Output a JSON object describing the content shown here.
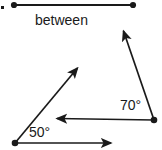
{
  "figure": {
    "background_color": "#ffffff",
    "stroke_color": "#1a1a1a",
    "labels": {
      "between": "between",
      "angle_right": "70°",
      "angle_left": "50°"
    },
    "geometry": {
      "segment_top": {
        "x1": 14,
        "y1": 5,
        "x2": 133,
        "y2": 5
      },
      "ray_upper_right": {
        "x1": 154,
        "y1": 120,
        "x2": 122,
        "y2": 27
      },
      "ray_horizontal_middle": {
        "x1": 154,
        "y1": 120,
        "x2": 53,
        "y2": 118
      },
      "ray_diagonal": {
        "x1": 15,
        "y1": 143,
        "x2": 80,
        "y2": 65
      },
      "ray_horizontal_bottom": {
        "x1": 15,
        "y1": 143,
        "x2": 115,
        "y2": 143
      },
      "vertex_right": {
        "x": 154,
        "y": 120
      },
      "vertex_bottom_left": {
        "x": 15,
        "y": 143
      },
      "endpoint_top_left": {
        "x": 14,
        "y": 5
      },
      "endpoint_top_right": {
        "x": 133,
        "y": 5
      }
    }
  }
}
